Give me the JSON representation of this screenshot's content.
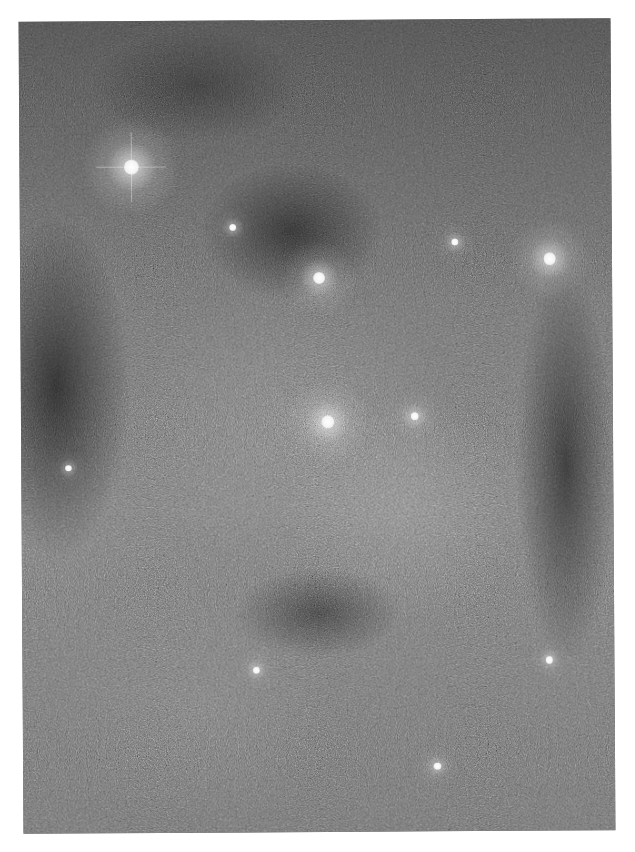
{
  "image": {
    "subject": "star field with dark nebula lanes",
    "tone": "grayscale",
    "colors": {
      "page_background": "#ffffff",
      "sky_mid": "#6e6e6e",
      "sky_dark": "#2a2a2a",
      "star": "#ffffff"
    }
  },
  "stars": [
    {
      "name": "bright-star-upper-left",
      "x": 0.19,
      "y": 0.18,
      "brightness": 1.0,
      "spikes": true
    },
    {
      "name": "star-upper-center",
      "x": 0.505,
      "y": 0.318,
      "brightness": 0.75,
      "spikes": false
    },
    {
      "name": "star-right",
      "x": 0.895,
      "y": 0.296,
      "brightness": 0.8,
      "spikes": false
    },
    {
      "name": "star-center",
      "x": 0.518,
      "y": 0.495,
      "brightness": 0.85,
      "spikes": false
    },
    {
      "name": "star-small-center-right",
      "x": 0.665,
      "y": 0.489,
      "brightness": 0.45,
      "spikes": false
    },
    {
      "name": "star-faint-1",
      "x": 0.36,
      "y": 0.255,
      "brightness": 0.35,
      "spikes": false
    },
    {
      "name": "star-faint-2",
      "x": 0.735,
      "y": 0.275,
      "brightness": 0.35,
      "spikes": false
    },
    {
      "name": "star-faint-3",
      "x": 0.395,
      "y": 0.8,
      "brightness": 0.35,
      "spikes": false
    },
    {
      "name": "star-faint-4",
      "x": 0.7,
      "y": 0.92,
      "brightness": 0.35,
      "spikes": false
    },
    {
      "name": "star-faint-5",
      "x": 0.89,
      "y": 0.79,
      "brightness": 0.35,
      "spikes": false
    },
    {
      "name": "star-faint-6",
      "x": 0.08,
      "y": 0.55,
      "brightness": 0.3,
      "spikes": false
    }
  ]
}
